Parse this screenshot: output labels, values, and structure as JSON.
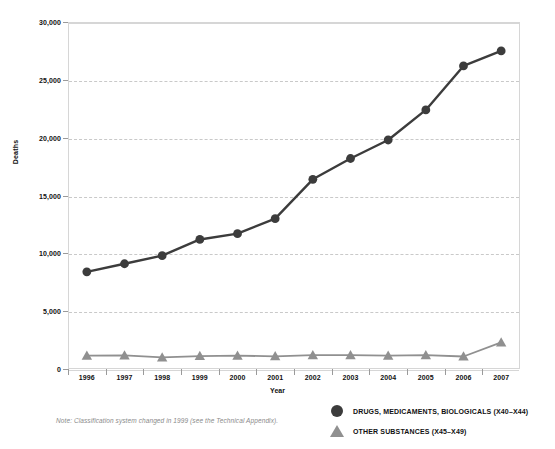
{
  "chart_data": {
    "type": "line",
    "title": "",
    "xlabel": "Year",
    "ylabel": "Deaths",
    "categories": [
      "1996",
      "1997",
      "1998",
      "1999",
      "2000",
      "2001",
      "2002",
      "2003",
      "2004",
      "2005",
      "2006",
      "2007"
    ],
    "x": [
      1996,
      1997,
      1998,
      1999,
      2000,
      2001,
      2002,
      2003,
      2004,
      2005,
      2006,
      2007
    ],
    "ylim": [
      0,
      30000
    ],
    "xlim": [
      1996,
      2007
    ],
    "yticks": [
      0,
      5000,
      10000,
      15000,
      20000,
      25000,
      30000
    ],
    "ytick_labels": [
      "0",
      "5,000",
      "10,000",
      "15,000",
      "20,000",
      "25,000",
      "30,000"
    ],
    "grid": true,
    "grid_style": "dashed-horizontal",
    "legend_position": "bottom-right",
    "series": [
      {
        "name": "DRUGS, MEDICAMENTS, BIOLOGICALS (X40–X44)",
        "marker": "circle",
        "color": "#3c3c3c",
        "values": [
          8400,
          9100,
          9800,
          11200,
          11700,
          13000,
          16400,
          18200,
          19800,
          22400,
          26200,
          27500
        ]
      },
      {
        "name": "OTHER SUBSTANCES (X45–X49)",
        "marker": "triangle",
        "color": "#909090",
        "values": [
          1150,
          1180,
          1000,
          1120,
          1150,
          1100,
          1200,
          1200,
          1150,
          1200,
          1080,
          2300
        ]
      }
    ],
    "note": "Note: Classification system changed in 1999 (see the Technical Appendix)."
  },
  "legend": {
    "items": [
      {
        "label": "DRUGS, MEDICAMENTS, BIOLOGICALS (X40–X44)",
        "marker": "circle",
        "color": "#3c3c3c"
      },
      {
        "label": "OTHER SUBSTANCES (X45–X49)",
        "marker": "triangle",
        "color": "#909090"
      }
    ]
  },
  "axes": {
    "y_title": "Deaths",
    "x_title": "Year"
  }
}
